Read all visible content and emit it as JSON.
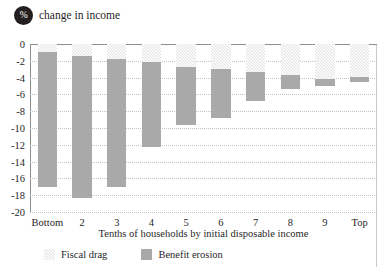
{
  "header": {
    "badge_symbol": "%",
    "title": "change in income"
  },
  "legend": {
    "items": [
      {
        "label": "Fiscal drag",
        "color": "#e2e2e2",
        "pattern": "hatched"
      },
      {
        "label": "Benefit erosion",
        "color": "#a9a9a9",
        "pattern": "solid"
      }
    ]
  },
  "chart_data": {
    "type": "bar",
    "stacked": true,
    "orientation": "vertical",
    "title": "% change in income",
    "xlabel": "Tenths of households by initial disposable income",
    "ylabel": "",
    "categories": [
      "Bottom",
      "2",
      "3",
      "4",
      "5",
      "6",
      "7",
      "8",
      "9",
      "Top"
    ],
    "series": [
      {
        "name": "Fiscal drag",
        "color": "#e2e2e2",
        "values": [
          -0.9,
          -1.4,
          -1.8,
          -2.1,
          -2.7,
          -3.0,
          -3.3,
          -3.7,
          -4.2,
          -3.9
        ]
      },
      {
        "name": "Benefit erosion",
        "color": "#a9a9a9",
        "values": [
          -16.1,
          -16.9,
          -15.2,
          -10.2,
          -7.0,
          -5.8,
          -3.5,
          -1.6,
          -0.8,
          -0.6
        ]
      }
    ],
    "totals": [
      -17.0,
      -18.3,
      -17.0,
      -12.3,
      -9.7,
      -8.8,
      -6.8,
      -5.3,
      -5.0,
      -4.5
    ],
    "ylim": [
      -20,
      0
    ],
    "ytick_values": [
      0,
      -2,
      -4,
      -6,
      -8,
      -10,
      -12,
      -14,
      -16,
      -18,
      -20
    ],
    "ytick_labels": [
      "0",
      "-2",
      "-4",
      "-6",
      "-8",
      "-10",
      "-12",
      "-14",
      "-16",
      "-18",
      "-20"
    ],
    "grid": true,
    "gridline_color": "#b9c6cf",
    "legend_position": "bottom-left"
  },
  "axis": {
    "x_title": "Tenths of households by initial disposable income"
  }
}
